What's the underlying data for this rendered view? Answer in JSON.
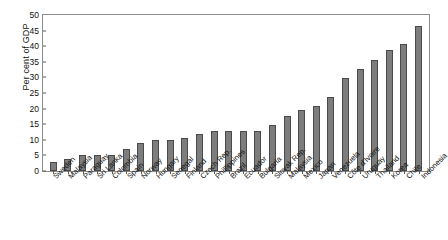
{
  "chart_data": {
    "type": "bar",
    "title": "",
    "xlabel": "",
    "ylabel": "Per cent of GDP",
    "ylim": [
      0,
      50
    ],
    "yticks": [
      0,
      5,
      10,
      15,
      20,
      25,
      30,
      35,
      40,
      45,
      50
    ],
    "grid": false,
    "legend": "none",
    "bar_color": "#7d7d7d",
    "bar_edge_color": "#4a4a4a",
    "axis_color": "#8c8c8c",
    "categories": [
      "Sweden",
      "Malaysia",
      "Paraguay",
      "Sri Lanka",
      "Colombia",
      "Spain",
      "Norway",
      "Hungary",
      "Senegal",
      "Finland",
      "Czech Rep.",
      "Phillippines",
      "Brazil",
      "Ecuador",
      "Bulgaria",
      "Slovak Rep.",
      "Malaysia",
      "Mexico",
      "Japan",
      "Venezuela",
      "Côte d'Ivoire",
      "Uruguay",
      "Thailand",
      "Korea",
      "Chile",
      "Indonesia"
    ],
    "values": [
      2.9,
      4.0,
      5.0,
      5.0,
      5.0,
      6.9,
      8.9,
      9.8,
      9.8,
      10.7,
      11.8,
      12.8,
      12.7,
      12.8,
      12.8,
      14.8,
      17.7,
      19.7,
      20.7,
      23.8,
      29.7,
      32.7,
      35.6,
      38.7,
      40.6,
      46.5
    ]
  }
}
